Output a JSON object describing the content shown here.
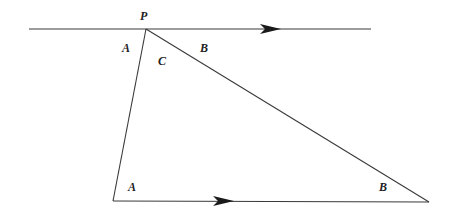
{
  "diagram": {
    "labels": {
      "apex": "P",
      "top_left_angle": "A",
      "top_right_angle": "B",
      "apex_angle": "C",
      "bottom_left_angle": "A",
      "bottom_right_angle": "B"
    },
    "arrows": {
      "top_line": "parallel-arrow",
      "base_line": "parallel-arrow"
    },
    "colors": {
      "stroke": "#3a3a3a",
      "arrowhead": "#1a1a1a",
      "text": "#222222",
      "background": "#ffffff"
    }
  }
}
